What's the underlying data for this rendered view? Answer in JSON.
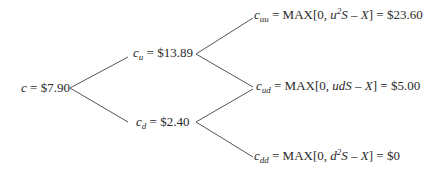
{
  "diagram": {
    "type": "binomial-tree",
    "line_color": "#555555",
    "root": {
      "var": "c",
      "eq": " = ",
      "value": "$7.90"
    },
    "level1": {
      "up": {
        "var": "c",
        "sub": "u",
        "eq": " = ",
        "value": "$13.89"
      },
      "down": {
        "var": "c",
        "sub": "d",
        "eq": " = ",
        "value": "$2.40"
      }
    },
    "level2": {
      "uu": {
        "var": "c",
        "sub": "uu",
        "eq": " = MAX[0, ",
        "f1": "u",
        "sup": "2",
        "f2": "S",
        "minus": " – ",
        "x": "X",
        "close": "] = ",
        "value": "$23.60"
      },
      "ud": {
        "var": "c",
        "sub": "ud",
        "eq": " = MAX[0, ",
        "f1": "udS",
        "minus": " – ",
        "x": "X",
        "close": "] = ",
        "value": "$5.00"
      },
      "dd": {
        "var": "c",
        "sub": "dd",
        "eq": " = MAX[0, ",
        "f1": "d",
        "sup": "2",
        "f2": "S",
        "minus": " – ",
        "x": "X",
        "close": "] = ",
        "value": "$0"
      }
    }
  }
}
